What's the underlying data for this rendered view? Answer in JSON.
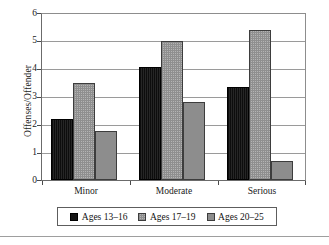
{
  "chart_data": {
    "type": "bar",
    "title": "",
    "subtitle": "",
    "xlabel": "",
    "ylabel": "Offenses/Offender",
    "categories": [
      "Minor",
      "Moderate",
      "Serious"
    ],
    "series": [
      {
        "name": "Ages 13–16",
        "values": [
          2.2,
          4.05,
          3.35
        ],
        "color": "#151515",
        "fill": "solid-dark"
      },
      {
        "name": "Ages 17–19",
        "values": [
          3.5,
          5.0,
          5.4
        ],
        "color": "#b4b4b4",
        "fill": "checkerboard-grey"
      },
      {
        "name": "Ages 20–25",
        "values": [
          1.75,
          2.8,
          0.7
        ],
        "color": "#8d8d8d",
        "fill": "solid-grey"
      }
    ],
    "ylim": [
      0,
      6
    ],
    "yticks": [
      0,
      1,
      2,
      3,
      4,
      5,
      6
    ],
    "ytick_labels": [
      "0",
      "1",
      "2",
      "3",
      "4",
      "5",
      "6"
    ],
    "grid": "horizontal",
    "legend_position": "bottom",
    "legend_entries": [
      "Ages 13–16",
      "Ages 17–19",
      "Ages 20–25"
    ]
  }
}
